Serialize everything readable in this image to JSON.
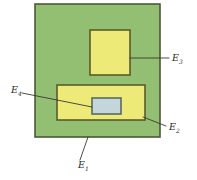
{
  "figure": {
    "background_color": "#ffffff",
    "width": 197,
    "height": 180
  },
  "colors": {
    "outer_green_fill": "#93bf72",
    "outer_green_stroke": "#4a5a33",
    "yellow_fill": "#eeea78",
    "yellow_stroke": "#5c5a2a",
    "inner_blue_fill": "#c3d6dc",
    "inner_blue_stroke": "#5a6a62",
    "leader_stroke": "#3a3a30",
    "label_text": "#2b2b25"
  },
  "regions": [
    {
      "id": "E1",
      "name": "outer-region",
      "label_base": "E",
      "label_sub": "1",
      "fill": "#93bf72",
      "stroke": "#4a5a33",
      "x": 35,
      "y": 4,
      "width": 125,
      "height": 133
    },
    {
      "id": "E3",
      "name": "upper-yellow-region",
      "label_base": "E",
      "label_sub": "3",
      "fill": "#eeea78",
      "stroke": "#5c5a2a",
      "x": 90,
      "y": 30,
      "width": 40,
      "height": 45
    },
    {
      "id": "E2",
      "name": "lower-yellow-region",
      "label_base": "E",
      "label_sub": "2",
      "fill": "#eeea78",
      "stroke": "#5c5a2a",
      "x": 57,
      "y": 85,
      "width": 88,
      "height": 35
    },
    {
      "id": "E4",
      "name": "inner-blue-region",
      "label_base": "E",
      "label_sub": "4",
      "fill": "#c3d6dc",
      "stroke": "#5a6a62",
      "x": 92,
      "y": 98,
      "width": 29,
      "height": 16
    }
  ],
  "labels": [
    {
      "id": "E3",
      "name": "label-e3",
      "base": "E",
      "sub": "3",
      "x": 172,
      "y": 61
    },
    {
      "id": "E2",
      "name": "label-e2",
      "base": "E",
      "sub": "2",
      "x": 169,
      "y": 130
    },
    {
      "id": "E4",
      "name": "label-e4",
      "base": "E",
      "sub": "4",
      "x": 11,
      "y": 93
    },
    {
      "id": "E1",
      "name": "label-e1",
      "base": "E",
      "sub": "1",
      "x": 78,
      "y": 168
    }
  ],
  "leaders": [
    {
      "id": "E3",
      "name": "leader-line-e3",
      "points": "130,58 169,58"
    },
    {
      "id": "E2",
      "name": "leader-line-e2",
      "points": "143,117 166,126"
    },
    {
      "id": "E4",
      "name": "leader-line-e4",
      "points": "22,93 92,107"
    },
    {
      "id": "E1",
      "name": "leader-line-e1",
      "points": "88,137 80,160"
    }
  ]
}
